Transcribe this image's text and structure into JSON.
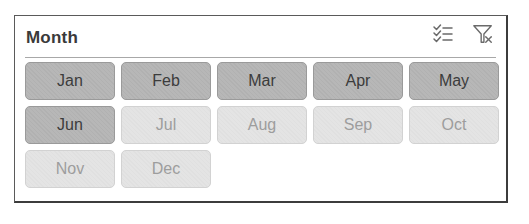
{
  "slicer": {
    "title": "Month",
    "icons": {
      "multi_select": "multi-select-icon",
      "clear_filter": "clear-filter-icon"
    },
    "colors": {
      "selected_bg": "#b7b7b7",
      "selected_text": "#3c3c3c",
      "unselected_bg": "#e4e4e4",
      "unselected_text": "#9d9d9d",
      "border": "#5a5a5a"
    },
    "items": [
      {
        "label": "Jan",
        "selected": true
      },
      {
        "label": "Feb",
        "selected": true
      },
      {
        "label": "Mar",
        "selected": true
      },
      {
        "label": "Apr",
        "selected": true
      },
      {
        "label": "May",
        "selected": true
      },
      {
        "label": "Jun",
        "selected": true
      },
      {
        "label": "Jul",
        "selected": false
      },
      {
        "label": "Aug",
        "selected": false
      },
      {
        "label": "Sep",
        "selected": false
      },
      {
        "label": "Oct",
        "selected": false
      },
      {
        "label": "Nov",
        "selected": false
      },
      {
        "label": "Dec",
        "selected": false
      }
    ]
  }
}
